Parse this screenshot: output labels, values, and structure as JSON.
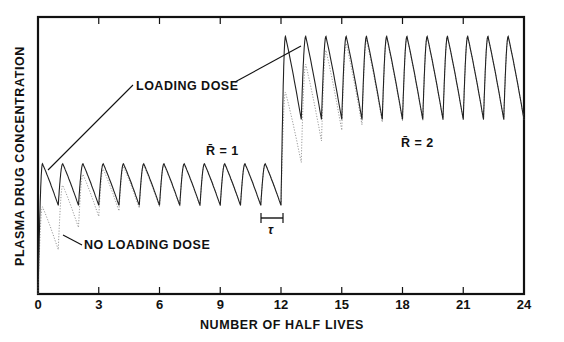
{
  "chart_data": {
    "type": "line",
    "title": "",
    "xlabel": "NUMBER OF HALF LIVES",
    "ylabel": "PLASMA DRUG CONCENTRATION",
    "xlim": [
      0,
      24
    ],
    "ylim": [
      0,
      1
    ],
    "grid": false,
    "x_ticks": [
      0,
      3,
      6,
      9,
      12,
      15,
      18,
      21,
      24
    ],
    "x_tick_labels": [
      "0",
      "3",
      "6",
      "9",
      "12",
      "15",
      "18",
      "21",
      "24"
    ],
    "dosing_interval_half_lives": 1,
    "series": [
      {
        "name": "LOADING DOSE",
        "style": "solid",
        "phases": [
          {
            "x_start": 0,
            "x_end": 12,
            "R_bar": 1,
            "peak": 0.47,
            "trough": 0.32
          },
          {
            "x_start": 12,
            "x_end": 24,
            "R_bar": 2,
            "peak": 0.93,
            "trough": 0.63
          }
        ]
      },
      {
        "name": "NO LOADING DOSE",
        "style": "dotted",
        "phases": [
          {
            "x_start": 0,
            "x_end": 12,
            "R_bar": 1,
            "peak_start": 0.22,
            "trough_start": 0.0,
            "approach_steady_state": true
          },
          {
            "x_start": 12,
            "x_end": 24,
            "R_bar": 1,
            "transition_to_R_bar": 2
          }
        ]
      }
    ],
    "annotations": [
      {
        "text": "LOADING DOSE",
        "x": 4.1,
        "y": 0.75
      },
      {
        "text": "NO LOADING DOSE",
        "x": 1.1,
        "y": 0.18
      },
      {
        "text": "R̄ = 1",
        "x": 9.3,
        "y": 0.53
      },
      {
        "text": "R̄ = 2",
        "x": 17.2,
        "y": 0.45
      },
      {
        "text": "τ",
        "x": 11.2,
        "y": 0.25,
        "meaning": "dosing interval"
      }
    ]
  },
  "labels": {
    "xlabel": "NUMBER OF HALF LIVES",
    "ylabel": "PLASMA DRUG CONCENTRATION",
    "loading": "LOADING DOSE",
    "no_loading": "NO LOADING DOSE",
    "r1": "R̄ = 1",
    "r2": "R̄ = 2",
    "tau": "τ",
    "ticks": [
      "0",
      "3",
      "6",
      "9",
      "12",
      "15",
      "18",
      "21",
      "24"
    ]
  }
}
